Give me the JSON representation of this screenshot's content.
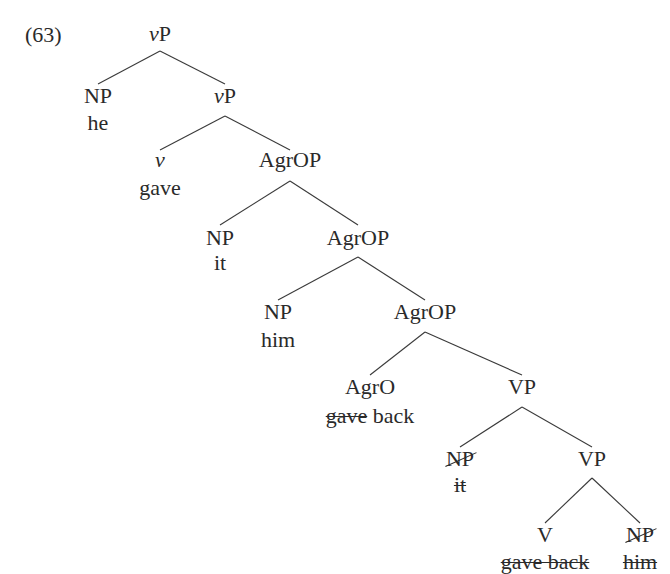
{
  "example_number": "(63)",
  "tree": {
    "nodes": [
      {
        "id": "n0",
        "label_prefix": "v",
        "label_suffix": "P",
        "word": "",
        "x": 160,
        "y": 34
      },
      {
        "id": "n1",
        "label": "NP",
        "word": "he",
        "x": 98,
        "y": 96
      },
      {
        "id": "n2",
        "label_prefix": "v",
        "label_suffix": "P",
        "word": "",
        "x": 225,
        "y": 96
      },
      {
        "id": "n3",
        "label_prefix": "v",
        "label_suffix": "",
        "word": "gave",
        "x": 160,
        "y": 160
      },
      {
        "id": "n4",
        "label": "AgrOP",
        "word": "",
        "x": 290,
        "y": 160
      },
      {
        "id": "n5",
        "label": "NP",
        "word": "it",
        "x": 220,
        "y": 238
      },
      {
        "id": "n6",
        "label": "AgrOP",
        "word": "",
        "x": 358,
        "y": 238
      },
      {
        "id": "n7",
        "label": "NP",
        "word": "him",
        "x": 278,
        "y": 312
      },
      {
        "id": "n8",
        "label": "AgrOP",
        "word": "",
        "x": 425,
        "y": 312
      },
      {
        "id": "n9",
        "label": "AgrO",
        "word_struck": "gave",
        "word": "back",
        "x": 370,
        "y": 387
      },
      {
        "id": "n10",
        "label": "VP",
        "word": "",
        "x": 522,
        "y": 387
      },
      {
        "id": "n11",
        "label_struck": "NP",
        "word_struck": "it",
        "x": 460,
        "y": 459
      },
      {
        "id": "n12",
        "label": "VP",
        "word": "",
        "x": 592,
        "y": 459
      },
      {
        "id": "n13",
        "label": "V",
        "word_struck": "gave back",
        "x": 545,
        "y": 535
      },
      {
        "id": "n14",
        "label_struck": "NP",
        "word_struck": "him",
        "x": 640,
        "y": 535
      }
    ],
    "edges": [
      [
        "n0",
        "n1"
      ],
      [
        "n0",
        "n2"
      ],
      [
        "n2",
        "n3"
      ],
      [
        "n2",
        "n4"
      ],
      [
        "n4",
        "n5"
      ],
      [
        "n4",
        "n6"
      ],
      [
        "n6",
        "n7"
      ],
      [
        "n6",
        "n8"
      ],
      [
        "n8",
        "n9"
      ],
      [
        "n8",
        "n10"
      ],
      [
        "n10",
        "n11"
      ],
      [
        "n10",
        "n12"
      ],
      [
        "n12",
        "n13"
      ],
      [
        "n12",
        "n14"
      ]
    ]
  },
  "labels": {
    "root": {
      "cat_italic": "v",
      "cat": "P"
    },
    "np_he": {
      "cat": "NP",
      "word": "he"
    },
    "vp_inner": {
      "cat_italic": "v",
      "cat": "P"
    },
    "v_head": {
      "cat_italic": "v",
      "word": "gave"
    },
    "agrop1": {
      "cat": "AgrOP"
    },
    "np_it": {
      "cat": "NP",
      "word": "it"
    },
    "agrop2": {
      "cat": "AgrOP"
    },
    "np_him": {
      "cat": "NP",
      "word": "him"
    },
    "agrop3": {
      "cat": "AgrOP"
    },
    "agro_head": {
      "cat": "AgrO",
      "word_struck": "gave",
      "word": "back"
    },
    "vp1": {
      "cat": "VP"
    },
    "np_it_trace": {
      "cat_struck": "NP",
      "word_struck": "it"
    },
    "vp2": {
      "cat": "VP"
    },
    "v_trace": {
      "cat": "V",
      "word_struck": "gave back"
    },
    "np_him_trace": {
      "cat_struck": "NP",
      "word_struck": "him"
    }
  }
}
